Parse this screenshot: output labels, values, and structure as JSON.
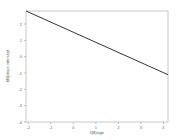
{
  "chart_data": {
    "type": "line",
    "title": "",
    "xlabel": "f(B)sign",
    "ylabel": "f(B)slope intercept",
    "xlim": [
      -2.1,
      4.2
    ],
    "ylim": [
      -4.0,
      2.8
    ],
    "xticks": [
      -2,
      -1,
      0,
      1,
      2,
      3,
      4
    ],
    "yticks": [
      2,
      1,
      0,
      -1,
      -2,
      -3,
      -4
    ],
    "grid": false,
    "legend": null,
    "series": [
      {
        "name": "line",
        "color": "#333333",
        "x": [
          -2.1,
          4.2
        ],
        "y": [
          2.8,
          -1.1
        ]
      }
    ]
  },
  "colors": {
    "frame": "#bbbbbb",
    "line": "#333333",
    "background": "#ffffff"
  }
}
